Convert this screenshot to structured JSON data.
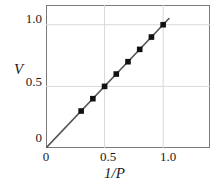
{
  "chart_data": {
    "type": "scatter",
    "title": "",
    "xlabel": "1/P",
    "ylabel": "V",
    "xlim": [
      0,
      1.4
    ],
    "ylim": [
      0,
      1.16
    ],
    "grid": true,
    "legend": "none",
    "x_ticks": [
      "0",
      "0.5",
      "1.0"
    ],
    "x_tick_values": [
      0,
      0.5,
      1.0
    ],
    "y_ticks": [
      "0",
      "0.5",
      "1.0"
    ],
    "y_tick_values": [
      0,
      0.5,
      1.0
    ],
    "series": [
      {
        "name": "V vs 1/P",
        "marker": "square",
        "marker_color": "#111111",
        "line_color": "#555555",
        "x": [
          0.3,
          0.4,
          0.5,
          0.6,
          0.7,
          0.8,
          0.9,
          1.0
        ],
        "y": [
          0.3,
          0.4,
          0.5,
          0.6,
          0.7,
          0.8,
          0.9,
          1.0
        ]
      }
    ],
    "fit_line": {
      "name": "proportional fit",
      "slope": 1.0,
      "intercept": 0.0,
      "x_start": 0.0,
      "y_start": 0.0,
      "x_end": 1.05,
      "y_end": 1.05,
      "color": "#555555"
    },
    "annotations": []
  },
  "axes": {
    "y_label": "V",
    "x_label": "1/P",
    "y_tick_top": "1.0",
    "y_tick_mid": "0.5",
    "y_tick_zero": "0",
    "x_tick_zero": "0",
    "x_tick_mid": "0.5",
    "x_tick_max": "1.0"
  },
  "colors": {
    "frame": "#7a7a7a",
    "grid": "#d8d8d8",
    "line": "#555555",
    "marker": "#111111",
    "background": "#ffffff",
    "text": "#1a1a1a"
  }
}
